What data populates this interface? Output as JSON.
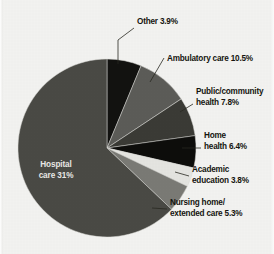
{
  "chart_data": {
    "type": "pie",
    "title": "",
    "subtitle": "",
    "xlabel": "",
    "ylabel": "",
    "legend_position": "callout-labels-right",
    "grid": false,
    "value_unit": "percent",
    "categories": [
      "Other",
      "Ambulatory care",
      "Public/community health",
      "Home health",
      "Academic education",
      "Nursing home/ extended care",
      "Hospital care"
    ],
    "values": [
      3.9,
      10.5,
      7.8,
      6.4,
      3.8,
      5.3,
      31
    ],
    "labels": [
      "Other 3.9%",
      "Ambulatory care 10.5%",
      "Public/community health 7.8%",
      "Home health 6.4%",
      "Academic education 3.8%",
      "Nursing home/ extended care 5.3%",
      "Hospital care 31%"
    ],
    "slices": [
      {
        "name": "other",
        "label": "Other 3.9%",
        "label_lines": [
          "Other 3.9%"
        ],
        "value": 3.9,
        "color": "#121210",
        "start_angle": 0,
        "end_angle": 22.5,
        "label_x": 137,
        "label_y": 24,
        "label_anchor": "start",
        "leader": "M 118 64 L 118 40 L 134 28"
      },
      {
        "name": "ambulatory-care",
        "label": "Ambulatory care 10.5%",
        "label_lines": [
          "Ambulatory care 10.5%"
        ],
        "value": 10.5,
        "color": "#5c5c58",
        "start_angle": 22.5,
        "end_angle": 56.5,
        "label_x": 167,
        "label_y": 61,
        "label_anchor": "start",
        "leader": "M 150 82 L 164 58"
      },
      {
        "name": "public-community-health",
        "label": "Public/community health 7.8%",
        "label_lines": [
          "Public/community",
          "health 7.8%"
        ],
        "value": 7.8,
        "color": "#3b3b36",
        "start_angle": 56.5,
        "end_angle": 82,
        "label_x": 196,
        "label_y": 94,
        "label_anchor": "start",
        "leader": "M 180 112 L 193 104"
      },
      {
        "name": "home-health",
        "label": "Home health 6.4%",
        "label_lines": [
          "Home",
          "health 6.4%"
        ],
        "value": 6.4,
        "color": "#0d0d0b",
        "start_angle": 82,
        "end_angle": 103,
        "label_x": 204,
        "label_y": 138,
        "label_anchor": "start",
        "leader": "M 182 148 L 201 148"
      },
      {
        "name": "academic-education",
        "label": "Academic education 3.8%",
        "label_lines": [
          "Academic",
          "education 3.8%"
        ],
        "value": 3.8,
        "color": "#e4e4e0",
        "start_angle": 103,
        "end_angle": 115.5,
        "label_x": 192,
        "label_y": 172,
        "label_anchor": "start",
        "leader": "M 175 172 L 189 176"
      },
      {
        "name": "nursing-home-extended-care",
        "label": "Nursing home/ extended care 5.3%",
        "label_lines": [
          "Nursing home/",
          "extended care 5.3%"
        ],
        "value": 5.3,
        "color": "#7a7a75",
        "start_angle": 115.5,
        "end_angle": 133.5,
        "label_x": 170,
        "label_y": 205,
        "label_anchor": "start",
        "leader": "M 152 208 L 167 209"
      },
      {
        "name": "hospital-care",
        "label": "Hospital care 31%",
        "label_lines": [
          "Hospital",
          "care 31%"
        ],
        "value": 31,
        "color": "#4a4a45",
        "start_angle": 133.5,
        "end_angle": 360,
        "label_x": 56,
        "label_y": 167,
        "label_anchor": "middle",
        "leader": ""
      }
    ],
    "geometry": {
      "center_x": 107,
      "center_y": 148,
      "radius": 89
    }
  },
  "page": {
    "background_color": "#f2f2f0",
    "text_color": "#15150f"
  }
}
